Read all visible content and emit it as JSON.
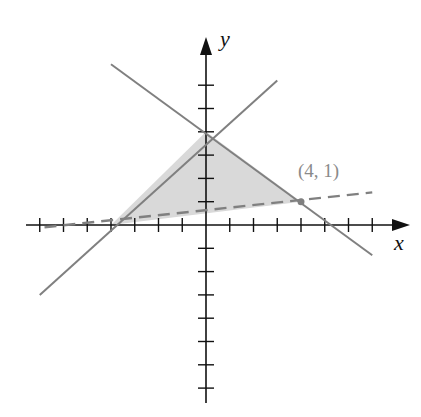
{
  "chart_data": {
    "type": "line",
    "title": "",
    "xlabel": "x",
    "ylabel": "y",
    "xlim": [
      -7,
      7
    ],
    "ylim": [
      -7,
      6
    ],
    "grid": false,
    "x_ticks": [
      -7,
      -6,
      -5,
      -4,
      -3,
      -2,
      -1,
      1,
      2,
      3,
      4,
      5,
      6,
      7
    ],
    "y_ticks": [
      -7,
      -6,
      -5,
      -4,
      -3,
      -2,
      -1,
      1,
      2,
      3,
      4,
      5,
      6
    ],
    "series": [
      {
        "name": "y = x + 4",
        "style": "solid",
        "x": [
          -7,
          3
        ],
        "y": [
          -3,
          6.2
        ]
      },
      {
        "name": "y = -0.75x + 4",
        "style": "solid",
        "x": [
          -4,
          7
        ],
        "y": [
          6.9,
          -1.3
        ]
      },
      {
        "name": "y = (x + 4)/8",
        "style": "dashed",
        "x": [
          -6.8,
          7
        ],
        "y": [
          -0.1,
          1.4
        ]
      }
    ],
    "shaded_region": {
      "vertices": [
        [
          -4,
          0
        ],
        [
          0,
          4
        ],
        [
          4,
          1
        ]
      ],
      "color": "#d9d9d9"
    },
    "annotations": [
      {
        "text": "(4, 1)",
        "x": 4,
        "y": 1
      }
    ],
    "colors": {
      "axis": "#111111",
      "line": "#808080",
      "fill": "#d9d9d9",
      "annotation": "#8a8a8a"
    }
  },
  "labels": {
    "x_axis": "x",
    "y_axis": "y",
    "point": "(4, 1)"
  }
}
